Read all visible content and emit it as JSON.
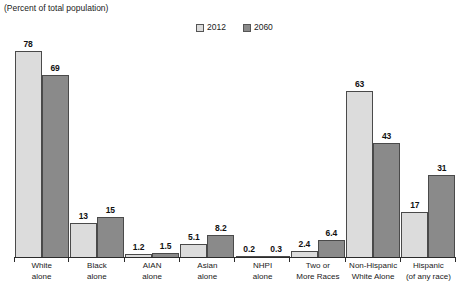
{
  "title": "(Percent of total population)",
  "legend": {
    "position": "top-center",
    "items": [
      {
        "label": "2012",
        "color": "#dcdcdc"
      },
      {
        "label": "2060",
        "color": "#8a8a8a"
      }
    ]
  },
  "colors": {
    "series_2012": "#dcdcdc",
    "series_2060": "#8a8a8a",
    "bar_border": "#4a4a4a",
    "axis": "#2b2b2b",
    "background": "#ffffff"
  },
  "chart_data": {
    "type": "bar",
    "title": "(Percent of total population)",
    "xlabel": "",
    "ylabel": "",
    "ylim": [
      0,
      78
    ],
    "grid": false,
    "legend_position": "top-center",
    "categories": [
      "White alone",
      "Black alone",
      "AIAN alone",
      "Asian alone",
      "NHPI alone",
      "Two or More Races",
      "Non-Hispanic White Alone",
      "Hispanic (of any race)"
    ],
    "category_lines": [
      [
        "White",
        "alone"
      ],
      [
        "Black",
        "alone"
      ],
      [
        "AIAN",
        "alone"
      ],
      [
        "Asian",
        "alone"
      ],
      [
        "NHPI",
        "alone"
      ],
      [
        "Two or",
        "More Races"
      ],
      [
        "Non-Hispanic",
        "White Alone"
      ],
      [
        "Hispanic",
        "(of any race)"
      ]
    ],
    "series": [
      {
        "name": "2012",
        "color": "#dcdcdc",
        "values": [
          78,
          13,
          1.2,
          5.1,
          0.2,
          2.4,
          63,
          17
        ],
        "labels": [
          "78",
          "13",
          "1.2",
          "5.1",
          "0.2",
          "2.4",
          "63",
          "17"
        ]
      },
      {
        "name": "2060",
        "color": "#8a8a8a",
        "values": [
          69,
          15,
          1.5,
          8.2,
          0.3,
          6.4,
          43,
          31
        ],
        "labels": [
          "69",
          "15",
          "1.5",
          "8.2",
          "0.3",
          "6.4",
          "43",
          "31"
        ]
      }
    ]
  }
}
